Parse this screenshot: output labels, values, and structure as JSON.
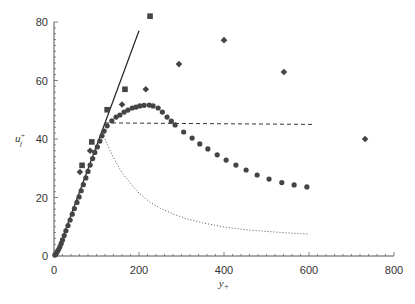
{
  "chart_data": {
    "type": "scatter",
    "title": "",
    "xlabel": "y+",
    "ylabel": "u+ (f)",
    "xlim": [
      0,
      800
    ],
    "ylim": [
      0,
      80
    ],
    "xticks": [
      0,
      200,
      400,
      600,
      800
    ],
    "yticks": [
      0,
      20,
      40,
      60,
      80
    ],
    "grid": false,
    "legend": null,
    "series": [
      {
        "name": "circles",
        "marker": "circle",
        "color": "#444444",
        "points": [
          [
            2,
            0.3
          ],
          [
            5,
            0.8
          ],
          [
            8,
            1.5
          ],
          [
            11,
            2.3
          ],
          [
            14,
            3.2
          ],
          [
            17,
            4.3
          ],
          [
            20,
            5.5
          ],
          [
            24,
            7
          ],
          [
            28,
            8.6
          ],
          [
            33,
            10.4
          ],
          [
            38,
            12.3
          ],
          [
            43,
            14.3
          ],
          [
            48,
            16.2
          ],
          [
            54,
            18.3
          ],
          [
            59,
            20.2
          ],
          [
            64,
            22.3
          ],
          [
            69,
            24.4
          ],
          [
            75,
            26.7
          ],
          [
            80,
            28.9
          ],
          [
            85,
            31.1
          ],
          [
            91,
            33.3
          ],
          [
            96,
            35.4
          ],
          [
            102,
            37.3
          ],
          [
            108,
            39.3
          ],
          [
            113,
            41.1
          ],
          [
            118,
            42.7
          ],
          [
            125,
            44.5
          ],
          [
            136,
            46.2
          ],
          [
            146,
            47.5
          ],
          [
            155,
            48.2
          ],
          [
            165,
            49.2
          ],
          [
            174,
            49.9
          ],
          [
            184,
            50.6
          ],
          [
            193,
            50.9
          ],
          [
            202,
            51.3
          ],
          [
            212,
            51.5
          ],
          [
            224,
            51.6
          ],
          [
            233,
            51.3
          ],
          [
            245,
            50.6
          ],
          [
            255,
            49.2
          ],
          [
            266,
            47.5
          ],
          [
            276,
            46.1
          ],
          [
            285,
            44.8
          ],
          [
            305,
            42.4
          ],
          [
            325,
            40.3
          ],
          [
            343,
            38.3
          ],
          [
            362,
            36.6
          ],
          [
            384,
            34.6
          ],
          [
            405,
            32.8
          ],
          [
            428,
            31.1
          ],
          [
            452,
            29.4
          ],
          [
            478,
            27.7
          ],
          [
            506,
            26.3
          ],
          [
            536,
            25.1
          ],
          [
            565,
            24.3
          ],
          [
            595,
            23.6
          ]
        ]
      },
      {
        "name": "squares",
        "marker": "square",
        "color": "#444444",
        "points": [
          [
            66,
            31
          ],
          [
            89,
            39
          ],
          [
            125,
            50
          ],
          [
            167,
            57
          ],
          [
            226,
            82
          ]
        ]
      },
      {
        "name": "diamonds",
        "marker": "diamond",
        "color": "#444444",
        "points": [
          [
            61,
            28.7
          ],
          [
            85,
            36
          ],
          [
            160,
            51.8
          ],
          [
            216,
            57
          ],
          [
            294,
            65.6
          ],
          [
            400,
            73.8
          ],
          [
            541,
            62.9
          ],
          [
            732,
            40
          ]
        ]
      },
      {
        "name": "linear-law",
        "style": "solid",
        "color": "#222222",
        "points": [
          [
            21,
            6.5
          ],
          [
            200,
            77
          ]
        ]
      },
      {
        "name": "plateau",
        "style": "dashed",
        "color": "#333333",
        "points": [
          [
            120,
            45.5
          ],
          [
            610,
            45
          ]
        ]
      },
      {
        "name": "decay",
        "style": "dotted",
        "color": "#555555",
        "points": [
          [
            120,
            40
          ],
          [
            132,
            36
          ],
          [
            144,
            32.5
          ],
          [
            160,
            28.5
          ],
          [
            180,
            24.8
          ],
          [
            200,
            21.5
          ],
          [
            225,
            18.5
          ],
          [
            250,
            16.3
          ],
          [
            280,
            14.4
          ],
          [
            310,
            12.8
          ],
          [
            350,
            11.3
          ],
          [
            400,
            9.9
          ],
          [
            450,
            9
          ],
          [
            500,
            8.4
          ],
          [
            550,
            7.9
          ],
          [
            600,
            7.5
          ]
        ]
      }
    ]
  },
  "axes": {
    "x_ticks": [
      "0",
      "200",
      "400",
      "600",
      "800"
    ],
    "y_ticks": [
      "0",
      "20",
      "40",
      "60",
      "80"
    ],
    "x_label": "y+",
    "y_label": "u+"
  }
}
